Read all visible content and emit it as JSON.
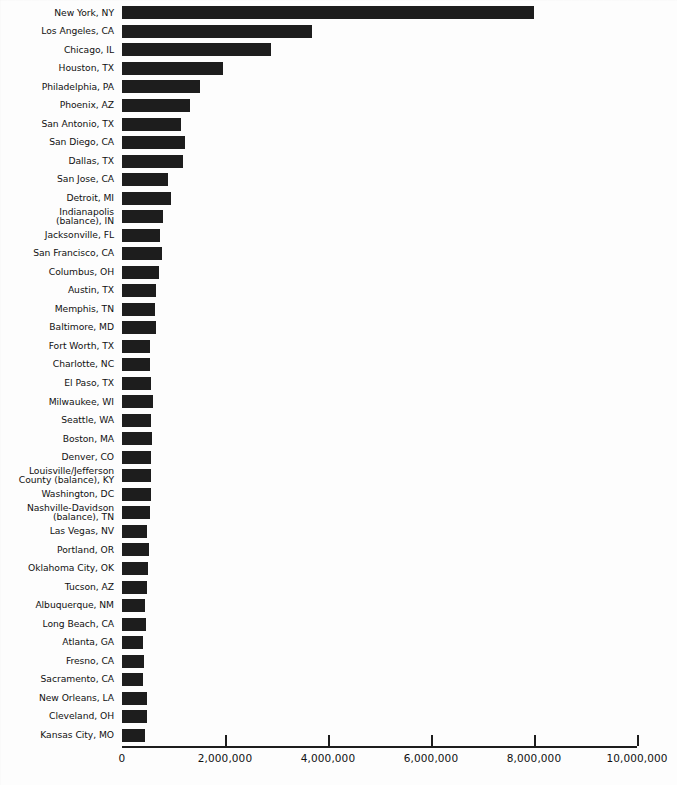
{
  "chart_data": {
    "type": "bar",
    "orientation": "horizontal",
    "title": "",
    "xlabel": "",
    "ylabel": "",
    "xlim": [
      0,
      10000000
    ],
    "xticks": [
      0,
      2000000,
      4000000,
      6000000,
      8000000,
      10000000
    ],
    "xtick_labels": [
      "0",
      "2,000,000",
      "4,000,000",
      "6,000,000",
      "8,000,000",
      "10,000,000"
    ],
    "grid": false,
    "legend": null,
    "bar_color": "#1d1d1d",
    "categories": [
      "New York, NY",
      "Los Angeles, CA",
      "Chicago, IL",
      "Houston, TX",
      "Philadelphia, PA",
      "Phoenix, AZ",
      "San Antonio, TX",
      "San Diego, CA",
      "Dallas, TX",
      "San Jose, CA",
      "Detroit, MI",
      "Indianapolis\n(balance), IN",
      "Jacksonville, FL",
      "San Francisco, CA",
      "Columbus, OH",
      "Austin, TX",
      "Memphis, TN",
      "Baltimore, MD",
      "Fort Worth, TX",
      "Charlotte, NC",
      "El Paso, TX",
      "Milwaukee, WI",
      "Seattle, WA",
      "Boston, MA",
      "Denver, CO",
      "Louisville/Jefferson\nCounty (balance), KY",
      "Washington, DC",
      "Nashville-Davidson\n(balance), TN",
      "Las Vegas, NV",
      "Portland, OR",
      "Oklahoma City, OK",
      "Tucson, AZ",
      "Albuquerque, NM",
      "Long Beach, CA",
      "Atlanta, GA",
      "Fresno, CA",
      "Sacramento, CA",
      "New Orleans, LA",
      "Cleveland, OH",
      "Kansas City, MO"
    ],
    "values": [
      8008278,
      3694820,
      2896016,
      1953631,
      1517550,
      1321045,
      1144646,
      1223400,
      1188580,
      894943,
      951270,
      791926,
      735617,
      776733,
      711470,
      656562,
      650100,
      651154,
      534694,
      540828,
      563662,
      596974,
      563374,
      589141,
      554636,
      556429,
      572059,
      545524,
      478434,
      529121,
      506132,
      486699,
      448607,
      461522,
      416474,
      427652,
      407018,
      484674,
      478403,
      441545
    ]
  }
}
